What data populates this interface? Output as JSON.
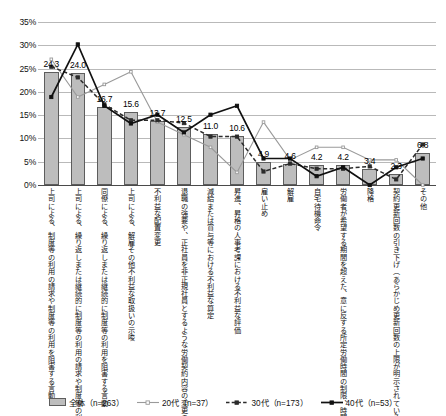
{
  "chart_data": {
    "type": "bar",
    "title": "",
    "xlabel": "",
    "ylabel": "",
    "ylim": [
      0,
      35
    ],
    "ytick_labels": [
      "0%",
      "5%",
      "10%",
      "15%",
      "20%",
      "25%",
      "30%",
      "35%"
    ],
    "ytick_values": [
      0,
      5,
      10,
      15,
      20,
      25,
      30,
      35
    ],
    "grid": true,
    "legend_position": "bottom",
    "categories": [
      "上司による、制度等の利用の請求や制度等の利用を阻害する言動",
      "上司による、繰り返しまたは継続的に制度等の利用の請求や制度等の利用を阻害する言動",
      "同僚による、繰り返しまたは継続的に制度等の利用を阻害する言動",
      "上司による、解雇その他不利益な取扱いの示唆",
      "不利益な配置変更",
      "退職の強要や、正社員を非正規社員とするような労働契約内容の変更の強要",
      "減給または賞与等における不利益な算定",
      "昇進、昇格の人事考課における不利益な評価",
      "雇い止め",
      "解雇",
      "自宅待機命令",
      "労働者が希望する期間を超えた、意に反する所定労働時間の制限、時間外労働の制限等の適用",
      "降格",
      "契約更新回数の引き下げ（あらかじめ更新回数の上限が明示されている場合）",
      "その他"
    ],
    "bar_series": {
      "name": "全体",
      "n": 263,
      "legend_label": "全体（n=263）",
      "color": "#bdbdbd",
      "values": [
        24.3,
        24.0,
        16.7,
        15.6,
        13.7,
        12.5,
        11.0,
        10.6,
        4.9,
        4.6,
        4.2,
        4.2,
        3.4,
        2.3,
        6.8
      ],
      "data_labels": [
        "24.3",
        "24.0",
        "16.7",
        "15.6",
        "13.7",
        "12.5",
        "11.0",
        "10.6",
        "4.9",
        "4.6",
        "4.2",
        "4.2",
        "3.4",
        "2.3",
        "6.8"
      ]
    },
    "series": [
      {
        "name": "20代",
        "n": 37,
        "legend_label": "20代（n=37）",
        "style": "solid-light",
        "color": "#9a9a9a",
        "values": [
          27.0,
          18.9,
          21.6,
          24.3,
          13.5,
          10.8,
          8.1,
          2.7,
          13.5,
          5.4,
          8.1,
          8.1,
          5.4,
          5.4,
          0.0
        ]
      },
      {
        "name": "30代",
        "n": 173,
        "legend_label": "30代（n=173）",
        "style": "dashed",
        "color": "#2b2b2b",
        "values": [
          25.4,
          23.1,
          17.3,
          13.9,
          13.9,
          13.3,
          10.4,
          10.4,
          2.9,
          4.6,
          3.5,
          3.5,
          4.0,
          1.2,
          8.7
        ]
      },
      {
        "name": "40代",
        "n": 53,
        "legend_label": "40代（n=53）",
        "style": "solid-dark",
        "color": "#111111",
        "values": [
          18.9,
          30.2,
          17.0,
          13.2,
          15.1,
          11.3,
          15.1,
          17.0,
          5.7,
          5.7,
          1.9,
          3.8,
          0.0,
          3.8,
          5.7
        ]
      }
    ]
  }
}
